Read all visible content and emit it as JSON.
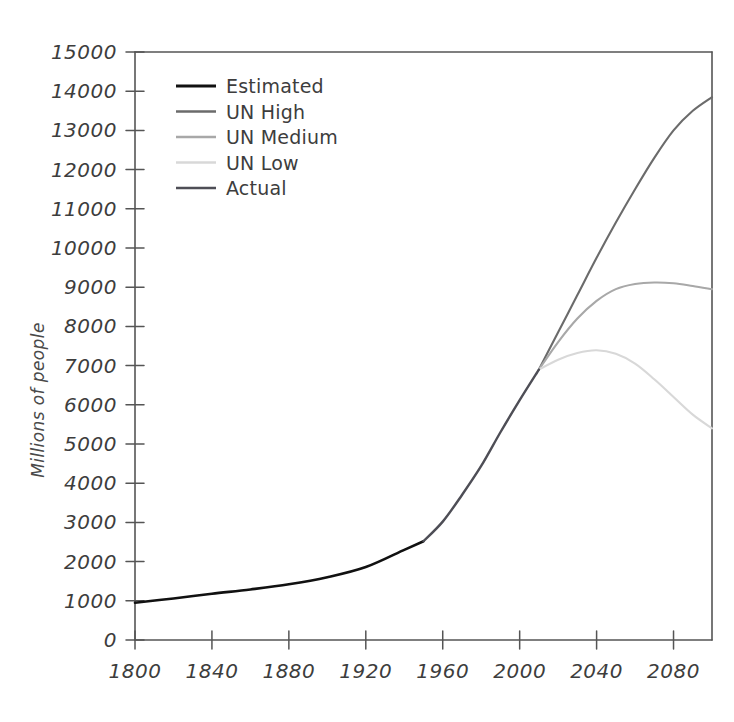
{
  "chart_data": {
    "type": "line",
    "title": "",
    "subtitle": "",
    "xlabel": "",
    "ylabel": "Millions of people",
    "xlim": [
      1800,
      2100
    ],
    "ylim": [
      0,
      15000
    ],
    "grid": false,
    "legend_position": "upper left",
    "xticks": [
      1800,
      1840,
      1880,
      1920,
      1960,
      2000,
      2040,
      2080
    ],
    "xticklabels": [
      "1800",
      "1840",
      "1880",
      "1920",
      "1960",
      "2000",
      "2040",
      "2080"
    ],
    "yticks": [
      0,
      1000,
      2000,
      3000,
      4000,
      5000,
      6000,
      7000,
      8000,
      9000,
      10000,
      11000,
      12000,
      13000,
      14000,
      15000
    ],
    "yticklabels": [
      "0",
      "1000",
      "2000",
      "3000",
      "4000",
      "5000",
      "6000",
      "7000",
      "8000",
      "9000",
      "10000",
      "11000",
      "12000",
      "13000",
      "14000",
      "15000"
    ],
    "series": [
      {
        "name": "Estimated",
        "color": "#111111",
        "linewidth": 2.6,
        "x": [
          1800,
          1820,
          1840,
          1860,
          1880,
          1900,
          1920,
          1940,
          1950
        ],
        "values": [
          950,
          1060,
          1180,
          1290,
          1420,
          1600,
          1860,
          2300,
          2520
        ]
      },
      {
        "name": "UN High",
        "color": "#6b6b6b",
        "linewidth": 2.1,
        "x": [
          2010,
          2020,
          2030,
          2040,
          2050,
          2060,
          2070,
          2080,
          2090,
          2100
        ],
        "values": [
          6900,
          7850,
          8800,
          9750,
          10650,
          11500,
          12300,
          13000,
          13500,
          13850
        ]
      },
      {
        "name": "UN Medium",
        "color": "#a8a8a8",
        "linewidth": 2.1,
        "x": [
          2010,
          2020,
          2030,
          2040,
          2050,
          2060,
          2070,
          2080,
          2090,
          2100
        ],
        "values": [
          6900,
          7600,
          8200,
          8650,
          8950,
          9080,
          9120,
          9100,
          9030,
          8950
        ]
      },
      {
        "name": "UN Low",
        "color": "#d8d8d8",
        "linewidth": 2.1,
        "x": [
          2010,
          2020,
          2030,
          2040,
          2050,
          2060,
          2070,
          2080,
          2090,
          2100
        ],
        "values": [
          6900,
          7150,
          7320,
          7390,
          7300,
          7050,
          6650,
          6200,
          5750,
          5400
        ]
      },
      {
        "name": "Actual",
        "color": "#4e4e56",
        "linewidth": 2.4,
        "x": [
          1950,
          1960,
          1970,
          1980,
          1990,
          2000,
          2010
        ],
        "values": [
          2520,
          3020,
          3700,
          4440,
          5300,
          6120,
          6900
        ]
      }
    ],
    "legend_entries": [
      {
        "label": "Estimated",
        "color": "#111111",
        "linewidth": 3.2
      },
      {
        "label": "UN High",
        "color": "#6b6b6b",
        "linewidth": 2.4
      },
      {
        "label": "UN Medium",
        "color": "#a8a8a8",
        "linewidth": 2.4
      },
      {
        "label": "UN Low",
        "color": "#d8d8d8",
        "linewidth": 2.4
      },
      {
        "label": "Actual",
        "color": "#4e4e56",
        "linewidth": 2.6
      }
    ]
  },
  "colors": {
    "background": "#ffffff",
    "axis": "#555555",
    "text": "#3d3d3d"
  }
}
